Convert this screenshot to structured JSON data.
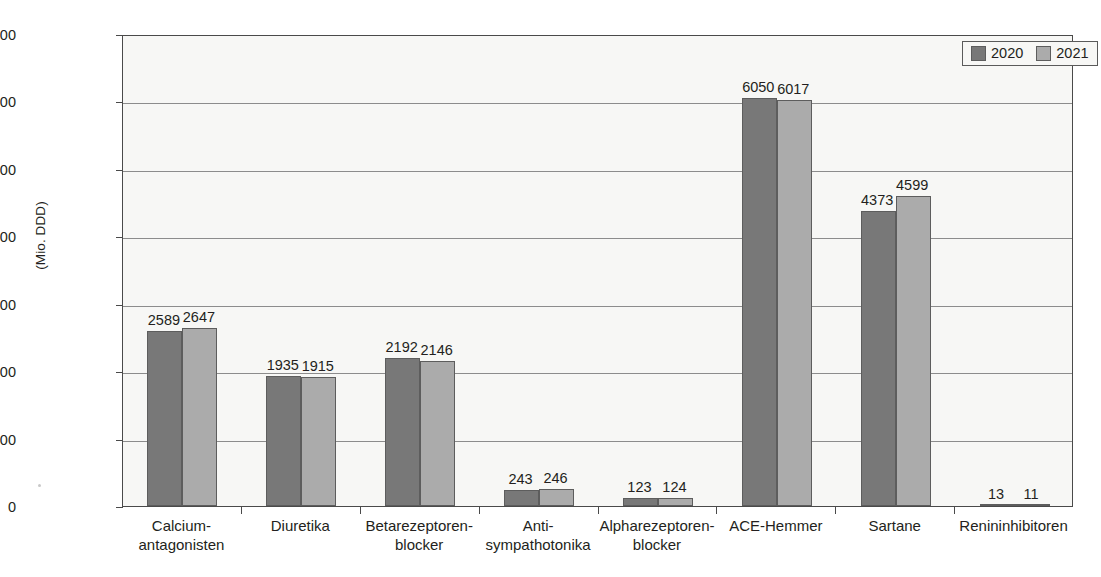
{
  "chart_data": {
    "type": "bar",
    "title": "",
    "subtitle": "",
    "xlabel": "",
    "ylabel": "(Mio. DDD)",
    "ylim": [
      0,
      7000
    ],
    "ytick_labels": [
      "0",
      "1000",
      "2000",
      "3000",
      "4000",
      "5000",
      "6000",
      "7000"
    ],
    "yticks": [
      0,
      1000,
      2000,
      3000,
      4000,
      5000,
      6000,
      7000
    ],
    "grid": true,
    "legend_position": "top-right",
    "categories": [
      "Calcium-antagonisten",
      "Diuretika",
      "Betarezeptoren-blocker",
      "Anti-sympathotonika",
      "Alpharezeptoren-blocker",
      "ACE-Hemmer",
      "Sartane",
      "Renininhibitoren"
    ],
    "category_lines": [
      [
        "Calcium-",
        "antagonisten"
      ],
      [
        "Diuretika",
        ""
      ],
      [
        "Betarezeptoren-",
        "blocker"
      ],
      [
        "Anti-",
        "sympathotonika"
      ],
      [
        "Alpharezeptoren-",
        "blocker"
      ],
      [
        "ACE-Hemmer",
        ""
      ],
      [
        "Sartane",
        ""
      ],
      [
        "Renininhibitoren",
        ""
      ]
    ],
    "series": [
      {
        "name": "2020",
        "color": "#787878",
        "values": [
          2589,
          1935,
          2192,
          243,
          123,
          6050,
          4373,
          13
        ]
      },
      {
        "name": "2021",
        "color": "#ababab",
        "values": [
          2647,
          1915,
          2146,
          246,
          124,
          6017,
          4599,
          11
        ]
      }
    ]
  },
  "legend": {
    "entries": [
      {
        "label": "2020",
        "color": "#787878"
      },
      {
        "label": "2021",
        "color": "#ababab"
      }
    ]
  },
  "axis": {
    "y_title": "(Mio. DDD)"
  }
}
